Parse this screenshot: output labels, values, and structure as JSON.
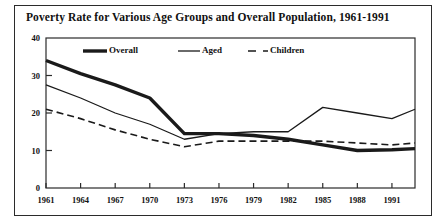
{
  "chart_data": {
    "type": "line",
    "title": "Poverty Rate for Various Age Groups and Overall Population, 1961-1991",
    "xlabel": "",
    "ylabel": "",
    "xlim": [
      1961,
      1993
    ],
    "ylim": [
      0,
      40
    ],
    "grid": false,
    "legend_position": "top-inside",
    "x_tick_labels": [
      "1961",
      "1964",
      "1967",
      "1970",
      "1973",
      "1976",
      "1979",
      "1982",
      "1985",
      "1988",
      "1991"
    ],
    "x_ticks": [
      1961,
      1964,
      1967,
      1970,
      1973,
      1976,
      1979,
      1982,
      1985,
      1988,
      1991
    ],
    "y_tick_labels": [
      "0",
      "10",
      "20",
      "30",
      "40"
    ],
    "y_ticks": [
      0,
      10,
      20,
      30,
      40
    ],
    "x": [
      1961,
      1964,
      1967,
      1970,
      1973,
      1976,
      1979,
      1982,
      1985,
      1988,
      1991,
      1993
    ],
    "series": [
      {
        "name": "Overall",
        "style": "thick-solid",
        "color": "#1a1a1a",
        "values": [
          34.0,
          30.5,
          27.5,
          24.0,
          14.5,
          14.5,
          14.0,
          13.0,
          11.5,
          10.0,
          10.2,
          10.5
        ]
      },
      {
        "name": "Aged",
        "style": "thin-solid",
        "color": "#1a1a1a",
        "values": [
          27.5,
          24.0,
          20.0,
          17.0,
          13.0,
          14.5,
          15.0,
          15.0,
          21.5,
          20.0,
          18.5,
          21.0
        ]
      },
      {
        "name": "Children",
        "style": "dashed",
        "color": "#1a1a1a",
        "values": [
          21.0,
          18.5,
          15.5,
          13.0,
          11.0,
          12.5,
          12.5,
          12.5,
          12.5,
          12.0,
          11.5,
          12.0
        ]
      }
    ],
    "legend": [
      {
        "label": "Overall",
        "style": "thick-solid"
      },
      {
        "label": "Aged",
        "style": "thin-solid"
      },
      {
        "label": "Children",
        "style": "dashed"
      }
    ]
  }
}
